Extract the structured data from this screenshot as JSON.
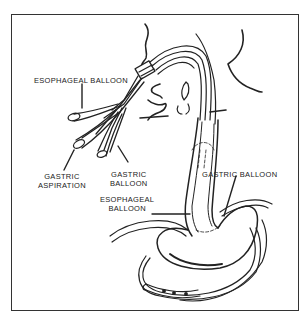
{
  "figure": {
    "labels": {
      "esophageal_balloon_port": "ESOPHAGEAL BALLOON",
      "gastric_aspiration_line1": "GASTRIC",
      "gastric_aspiration_line2": "ASPIRATION",
      "gastric_balloon_port_line1": "GASTRIC",
      "gastric_balloon_port_line2": "BALLOON",
      "esophageal_balloon_line1": "ESOPHAGEAL",
      "esophageal_balloon_line2": "BALLOON",
      "gastric_balloon": "GASTRIC BALLOON"
    },
    "colors": {
      "ink": "#222222",
      "background": "#ffffff"
    }
  }
}
